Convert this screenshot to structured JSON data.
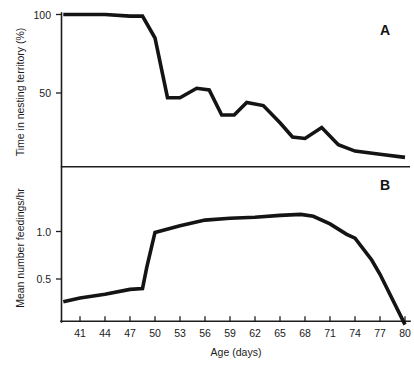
{
  "figure": {
    "panel_a_label": "A",
    "panel_b_label": "B",
    "x_axis_title": "Age (days)",
    "panel_a_y_title": "Time in nesting territory (%)",
    "panel_b_y_title": "Mean number feedings/hr",
    "line_color": "#141414",
    "axis_color": "#1d1d1d",
    "background_color": "#ffffff"
  },
  "x_tick_labels": [
    "41",
    "44",
    "47",
    "50",
    "53",
    "56",
    "59",
    "62",
    "65",
    "68",
    "71",
    "74",
    "77",
    "80"
  ],
  "panel_a_y_tick_labels": [
    "100",
    "50"
  ],
  "panel_b_y_tick_labels": [
    "1.0",
    "0.5"
  ],
  "chart_data": [
    {
      "type": "line",
      "title": "A",
      "xlabel": "Age (days)",
      "ylabel": "Time in nesting territory (%)",
      "xlim": [
        39,
        80
      ],
      "ylim": [
        0,
        105
      ],
      "grid": false,
      "legend": "none",
      "xticks": [
        41,
        44,
        47,
        50,
        53,
        56,
        59,
        62,
        65,
        68,
        71,
        74,
        77,
        80
      ],
      "yticks": [
        50,
        100
      ],
      "x": [
        39,
        41,
        44,
        47,
        48.5,
        50,
        51.5,
        53,
        55,
        56.5,
        58,
        59.5,
        61,
        63,
        65,
        66.5,
        68,
        70,
        72,
        74,
        77,
        80
      ],
      "values": [
        100,
        100,
        100,
        99,
        99,
        85,
        47,
        47,
        53,
        52,
        36,
        36,
        44,
        42,
        31,
        22,
        21,
        28,
        17,
        13,
        11,
        9
      ],
      "series": [
        {
          "name": "Time in nesting territory (%)",
          "values": [
            100,
            100,
            100,
            99,
            99,
            85,
            47,
            47,
            53,
            52,
            36,
            36,
            44,
            42,
            31,
            22,
            21,
            28,
            17,
            13,
            11,
            9
          ]
        }
      ]
    },
    {
      "type": "line",
      "title": "B",
      "xlabel": "Age (days)",
      "ylabel": "Mean number feedings/hr",
      "xlim": [
        39,
        80
      ],
      "ylim": [
        0,
        1.35
      ],
      "grid": false,
      "legend": "none",
      "xticks": [
        41,
        44,
        47,
        50,
        53,
        56,
        59,
        62,
        65,
        68,
        71,
        74,
        77,
        80
      ],
      "yticks": [
        0.5,
        1.0
      ],
      "x": [
        39,
        41,
        44,
        47,
        48.5,
        49,
        50,
        53,
        56,
        59,
        62,
        65,
        67.5,
        69,
        71,
        73,
        74,
        76,
        77,
        80
      ],
      "values": [
        0.26,
        0.3,
        0.34,
        0.39,
        0.4,
        0.62,
        0.99,
        1.06,
        1.12,
        1.14,
        1.15,
        1.17,
        1.18,
        1.16,
        1.08,
        0.97,
        0.93,
        0.7,
        0.55,
        0.02
      ],
      "series": [
        {
          "name": "Mean number feedings/hr",
          "values": [
            0.26,
            0.3,
            0.34,
            0.39,
            0.4,
            0.62,
            0.99,
            1.06,
            1.12,
            1.14,
            1.15,
            1.17,
            1.18,
            1.16,
            1.08,
            0.97,
            0.93,
            0.7,
            0.55,
            0.02
          ]
        }
      ]
    }
  ]
}
